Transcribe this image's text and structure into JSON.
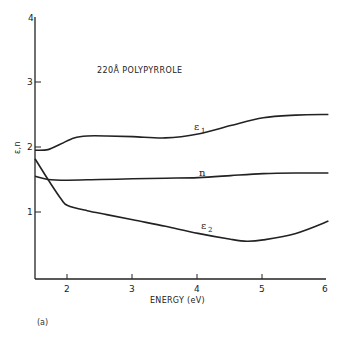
{
  "chart_data": {
    "type": "line",
    "title": "220Å POLYPYRROLE",
    "xlabel": "ENERGY (eV)",
    "ylabel": "ε,n",
    "xlim": [
      1.5,
      6
    ],
    "ylim": [
      0,
      4
    ],
    "xticks": [
      2,
      3,
      4,
      5,
      6
    ],
    "yticks": [
      1,
      2,
      3,
      4
    ],
    "grid": false,
    "legend": "inline labels on curves",
    "panel_label": "(a)",
    "series": [
      {
        "name": "ε1",
        "x": [
          1.5,
          1.7,
          1.9,
          2.1,
          2.3,
          2.6,
          3.0,
          3.5,
          4.0,
          4.5,
          5.0,
          5.5,
          6.0
        ],
        "values": [
          1.95,
          1.96,
          2.05,
          2.14,
          2.17,
          2.17,
          2.16,
          2.14,
          2.2,
          2.33,
          2.45,
          2.49,
          2.5
        ]
      },
      {
        "name": "n",
        "x": [
          1.5,
          1.7,
          2.0,
          2.5,
          3.0,
          3.5,
          4.0,
          4.5,
          5.0,
          5.5,
          6.0
        ],
        "values": [
          1.55,
          1.5,
          1.49,
          1.5,
          1.51,
          1.52,
          1.53,
          1.56,
          1.59,
          1.6,
          1.6
        ]
      },
      {
        "name": "ε2",
        "x": [
          1.5,
          1.7,
          1.9,
          2.0,
          2.3,
          2.6,
          3.0,
          3.5,
          4.0,
          4.5,
          4.75,
          5.0,
          5.5,
          6.0
        ],
        "values": [
          1.82,
          1.5,
          1.2,
          1.1,
          1.02,
          0.96,
          0.88,
          0.78,
          0.67,
          0.58,
          0.55,
          0.57,
          0.67,
          0.86
        ]
      }
    ]
  },
  "labels": {
    "title": "220Å POLYPYRROLE",
    "xlabel": "ENERGY (eV)",
    "ylabel": "ε,n",
    "panel": "(a)",
    "eps1_base": "ε",
    "eps1_sub": "1",
    "n": "n",
    "eps2_base": "ε",
    "eps2_sub": "2",
    "xticks": [
      "2",
      "3",
      "4",
      "5",
      "6"
    ],
    "yticks": [
      "1",
      "2",
      "3",
      "4"
    ]
  },
  "colors": {
    "ink": "#222222",
    "background": "#ffffff"
  }
}
